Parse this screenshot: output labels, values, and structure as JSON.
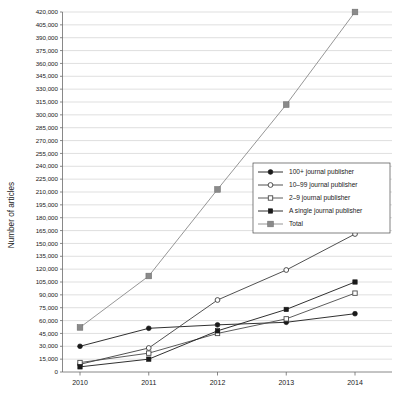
{
  "chart_data": {
    "type": "line",
    "title": "",
    "xlabel": "",
    "ylabel": "Number of articles",
    "categories": [
      "2010",
      "2011",
      "2012",
      "2013",
      "2014"
    ],
    "x": [
      2010,
      2011,
      2012,
      2013,
      2014
    ],
    "ylim": [
      0,
      420000
    ],
    "ytick_step": 15000,
    "grid": true,
    "legend_position": "center-right",
    "ytick_labels": [
      "420,000",
      "405,000",
      "390,000",
      "375,000",
      "360,000",
      "345,000",
      "330,000",
      "315,000",
      "300,000",
      "285,000",
      "270,000",
      "255,000",
      "240,000",
      "225,000",
      "210,000",
      "195,000",
      "180,000",
      "165,000",
      "150,000",
      "135,000",
      "120,000",
      "105,000",
      "90,000",
      "75,000",
      "60,000",
      "45,000",
      "30,000",
      "15,000",
      "0"
    ],
    "ytick_values": [
      420000,
      405000,
      390000,
      375000,
      360000,
      345000,
      330000,
      315000,
      300000,
      285000,
      270000,
      255000,
      240000,
      225000,
      210000,
      195000,
      180000,
      165000,
      150000,
      135000,
      120000,
      105000,
      90000,
      75000,
      60000,
      45000,
      30000,
      15000,
      0
    ],
    "series": [
      {
        "name": "100+ journal publisher",
        "marker": "filled-circle",
        "color": "#1a1a1a",
        "values": [
          30000,
          51000,
          55000,
          58000,
          68000
        ]
      },
      {
        "name": "10–99 journal publisher",
        "marker": "open-circle",
        "color": "#3d3d3d",
        "values": [
          9000,
          28000,
          84000,
          119000,
          161000
        ]
      },
      {
        "name": "2–9 journal publisher",
        "marker": "open-square",
        "color": "#4a4a4a",
        "values": [
          11000,
          22000,
          45000,
          62000,
          92000
        ]
      },
      {
        "name": "A single journal publisher",
        "marker": "filled-square",
        "color": "#1a1a1a",
        "values": [
          6000,
          15000,
          48000,
          73000,
          105000
        ]
      },
      {
        "name": "Total",
        "marker": "gray-filled-square",
        "color": "#8a8a8a",
        "values": [
          52000,
          112000,
          213000,
          312000,
          420000
        ]
      }
    ]
  },
  "legend": {
    "items": [
      {
        "label": "100+ journal publisher",
        "marker": "filled-circle"
      },
      {
        "label": "10–99 journal publisher",
        "marker": "open-circle"
      },
      {
        "label": "2–9 journal publisher",
        "marker": "open-square"
      },
      {
        "label": "A single journal publisher",
        "marker": "filled-square"
      },
      {
        "label": "Total",
        "marker": "gray-filled-square"
      }
    ]
  }
}
